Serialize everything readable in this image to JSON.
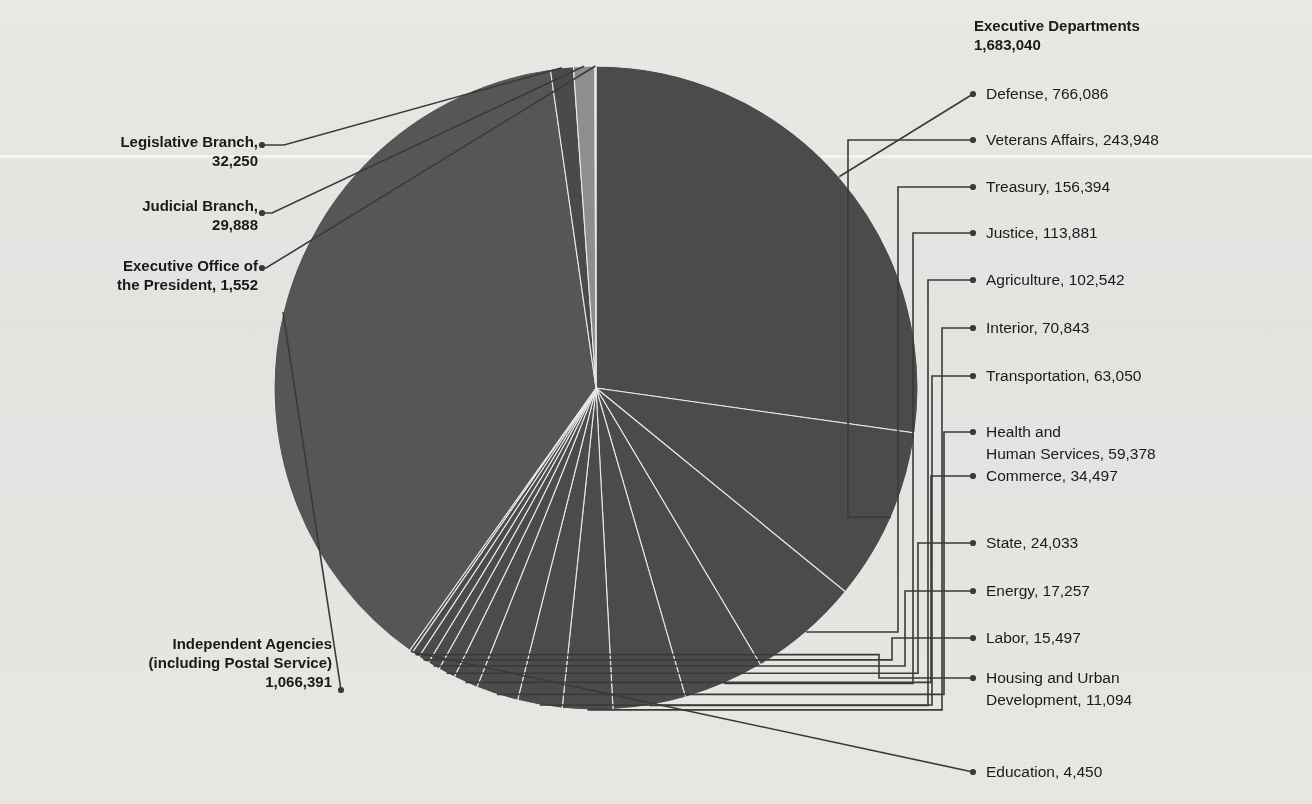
{
  "figure": {
    "background_color": "#f3f3f1",
    "label_color": "#1a1a1a",
    "leader_color": "#3a3a3a"
  },
  "headings": {
    "executive_departments_title": "Executive Departments",
    "executive_departments_total": "1,683,040"
  },
  "left_labels": [
    {
      "name": "legislative-branch",
      "line1": "Legislative Branch,",
      "line2": "32,250"
    },
    {
      "name": "judicial-branch",
      "line1": "Judicial Branch,",
      "line2": "29,888"
    },
    {
      "name": "executive-office-president",
      "line1": "Executive Office of",
      "line2": "the President, 1,552"
    },
    {
      "name": "independent-agencies",
      "line1": "Independent Agencies",
      "line2": "(including Postal Service)",
      "line3": "1,066,391"
    }
  ],
  "right_labels": [
    {
      "name": "defense",
      "text": "Defense, 766,086"
    },
    {
      "name": "veterans-affairs",
      "text": "Veterans Affairs, 243,948"
    },
    {
      "name": "treasury",
      "text": "Treasury, 156,394"
    },
    {
      "name": "justice",
      "text": "Justice, 113,881"
    },
    {
      "name": "agriculture",
      "text": "Agriculture, 102,542"
    },
    {
      "name": "interior",
      "text": "Interior, 70,843"
    },
    {
      "name": "transportation",
      "text": "Transportation, 63,050"
    },
    {
      "name": "health-human-services-l1",
      "text": "Health and"
    },
    {
      "name": "health-human-services-l2",
      "text": "Human Services, 59,378"
    },
    {
      "name": "commerce",
      "text": "Commerce, 34,497"
    },
    {
      "name": "state",
      "text": "State, 24,033"
    },
    {
      "name": "energy",
      "text": "Energy, 17,257"
    },
    {
      "name": "labor",
      "text": "Labor, 15,497"
    },
    {
      "name": "housing-urban-development-l1",
      "text": "Housing and Urban"
    },
    {
      "name": "housing-urban-development-l2",
      "text": "Development, 11,094"
    },
    {
      "name": "education",
      "text": "Education, 4,450"
    }
  ],
  "chart_data": {
    "type": "pie",
    "title": "Executive Departments",
    "total": 2813121,
    "grid": false,
    "legend": "callout-labels",
    "start_angle_deg": 0,
    "direction": "clockwise",
    "groups": [
      {
        "name": "Executive Departments",
        "value": 1683040
      },
      {
        "name": "Independent Agencies (including Postal Service)",
        "value": 1066391
      },
      {
        "name": "Legislative Branch",
        "value": 32250
      },
      {
        "name": "Judicial Branch",
        "value": 29888
      },
      {
        "name": "Executive Office of the President",
        "value": 1552
      }
    ],
    "labels": [
      "Defense",
      "Veterans Affairs",
      "Treasury",
      "Justice",
      "Agriculture",
      "Interior",
      "Transportation",
      "Health and Human Services",
      "Commerce",
      "State",
      "Energy",
      "Labor",
      "Housing and Urban Development",
      "Education",
      "Independent Agencies (including Postal Service)",
      "Legislative Branch",
      "Judicial Branch",
      "Executive Office of the President"
    ],
    "values": [
      766086,
      243948,
      156394,
      113881,
      102542,
      70843,
      63050,
      59378,
      34497,
      24033,
      17257,
      15497,
      11094,
      4450,
      1066391,
      32250,
      29888,
      1552
    ],
    "colors": [
      "#4b4b4b",
      "#4b4b4b",
      "#4b4b4b",
      "#4b4b4b",
      "#4b4b4b",
      "#4b4b4b",
      "#4b4b4b",
      "#4b4b4b",
      "#4b4b4b",
      "#4b4b4b",
      "#4b4b4b",
      "#4b4b4b",
      "#4b4b4b",
      "#4b4b4b",
      "#565656",
      "#4a4a4a",
      "#8e8e8e",
      "#6b6b6b"
    ],
    "xlabel": "",
    "ylabel": ""
  }
}
